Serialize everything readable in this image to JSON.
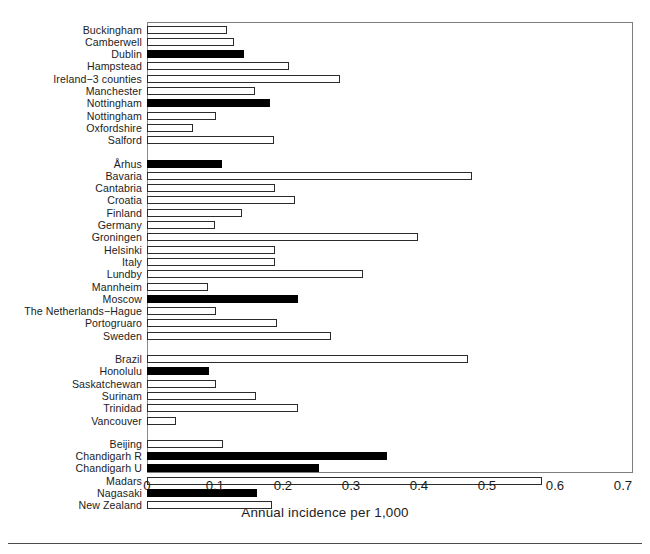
{
  "chart_data": {
    "type": "bar",
    "orientation": "horizontal",
    "title": "",
    "xlabel": "Annual incidence per 1,000",
    "ylabel": "",
    "xlim": [
      0,
      0.7
    ],
    "xticks": [
      "0",
      "0.1",
      "0.2",
      "0.3",
      "0.4",
      "0.5",
      "0.6",
      "0.7"
    ],
    "xtick_values": [
      0,
      0.1,
      0.2,
      0.3,
      0.4,
      0.5,
      0.6,
      0.7
    ],
    "grid": false,
    "legend": "none",
    "bar_styles": {
      "open": "white fill with black outline",
      "filled": "solid black fill"
    },
    "groups": [
      {
        "name": "group-1",
        "bars": [
          {
            "category": "Buckingham",
            "value": 0.118,
            "style": "open"
          },
          {
            "category": "Camberwell",
            "value": 0.128,
            "style": "open"
          },
          {
            "category": "Dublin",
            "value": 0.143,
            "style": "filled"
          },
          {
            "category": "Hampstead",
            "value": 0.209,
            "style": "open"
          },
          {
            "category": "Ireland−3 counties",
            "value": 0.284,
            "style": "open"
          },
          {
            "category": "Manchester",
            "value": 0.159,
            "style": "open"
          },
          {
            "category": "Nottingham",
            "value": 0.181,
            "style": "filled"
          },
          {
            "category": "Nottingham",
            "value": 0.102,
            "style": "open"
          },
          {
            "category": "Oxfordshire",
            "value": 0.068,
            "style": "open"
          },
          {
            "category": "Salford",
            "value": 0.187,
            "style": "open"
          }
        ]
      },
      {
        "name": "group-2",
        "bars": [
          {
            "category": "Århus",
            "value": 0.11,
            "style": "filled"
          },
          {
            "category": "Bavaria",
            "value": 0.478,
            "style": "open"
          },
          {
            "category": "Cantabria",
            "value": 0.188,
            "style": "open"
          },
          {
            "category": "Croatia",
            "value": 0.218,
            "style": "open"
          },
          {
            "category": "Finland",
            "value": 0.14,
            "style": "open"
          },
          {
            "category": "Germany",
            "value": 0.1,
            "style": "open"
          },
          {
            "category": "Groningen",
            "value": 0.399,
            "style": "open"
          },
          {
            "category": "Helsinki",
            "value": 0.188,
            "style": "open"
          },
          {
            "category": "Italy",
            "value": 0.188,
            "style": "open"
          },
          {
            "category": "Lundby",
            "value": 0.318,
            "style": "open"
          },
          {
            "category": "Mannheim",
            "value": 0.09,
            "style": "open"
          },
          {
            "category": "Moscow",
            "value": 0.222,
            "style": "filled"
          },
          {
            "category": "The Netherlands−Hague",
            "value": 0.101,
            "style": "open"
          },
          {
            "category": "Portogruaro",
            "value": 0.191,
            "style": "open"
          },
          {
            "category": "Sweden",
            "value": 0.27,
            "style": "open"
          }
        ]
      },
      {
        "name": "group-3",
        "bars": [
          {
            "category": "Brazil",
            "value": 0.472,
            "style": "open"
          },
          {
            "category": "Honolulu",
            "value": 0.091,
            "style": "filled"
          },
          {
            "category": "Saskatchewan",
            "value": 0.102,
            "style": "open"
          },
          {
            "category": "Surinam",
            "value": 0.16,
            "style": "open"
          },
          {
            "category": "Trinidad",
            "value": 0.222,
            "style": "open"
          },
          {
            "category": "Vancouver",
            "value": 0.042,
            "style": "open"
          }
        ]
      },
      {
        "name": "group-4",
        "bars": [
          {
            "category": "Beijing",
            "value": 0.112,
            "style": "open"
          },
          {
            "category": "Chandigarh R",
            "value": 0.353,
            "style": "filled"
          },
          {
            "category": "Chandigarh U",
            "value": 0.253,
            "style": "filled"
          },
          {
            "category": "Madars",
            "value": 0.581,
            "style": "open"
          },
          {
            "category": "Nagasaki",
            "value": 0.162,
            "style": "filled"
          },
          {
            "category": "New Zealand",
            "value": 0.184,
            "style": "open"
          }
        ]
      }
    ]
  }
}
